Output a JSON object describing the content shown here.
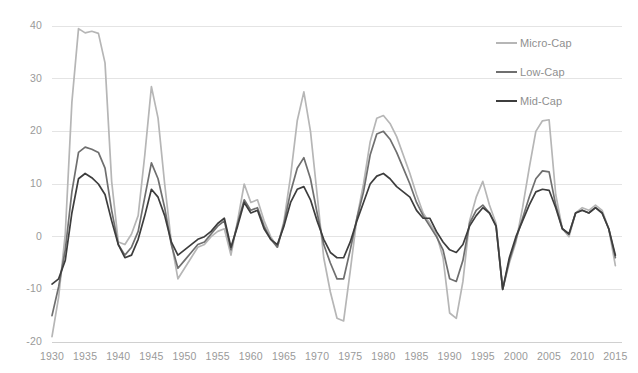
{
  "chart_data": {
    "type": "line",
    "title": "",
    "subtitle": "",
    "xlabel": "",
    "ylabel": "",
    "xlim": [
      1930,
      2016
    ],
    "ylim": [
      -20,
      40
    ],
    "ytick_values": [
      40,
      30,
      20,
      10,
      0,
      -10,
      -20
    ],
    "ytick_labels": [
      "40",
      "30",
      "20",
      "10",
      "0",
      "-10",
      "-20"
    ],
    "xtick_values": [
      1930,
      1935,
      1940,
      1945,
      1950,
      1955,
      1960,
      1965,
      1970,
      1975,
      1980,
      1985,
      1990,
      1995,
      2000,
      2005,
      2010,
      2015
    ],
    "xtick_labels": [
      "1930",
      "1935",
      "1940",
      "1945",
      "1950",
      "1955",
      "1960",
      "1965",
      "1970",
      "1975",
      "1980",
      "1985",
      "1990",
      "1995",
      "2000",
      "2005",
      "2010",
      "2015"
    ],
    "grid": "horizontal",
    "legend_position": "top-right",
    "x": [
      1930,
      1931,
      1932,
      1933,
      1934,
      1935,
      1936,
      1937,
      1938,
      1939,
      1940,
      1941,
      1942,
      1943,
      1944,
      1945,
      1946,
      1947,
      1948,
      1949,
      1950,
      1951,
      1952,
      1953,
      1954,
      1955,
      1956,
      1957,
      1958,
      1959,
      1960,
      1961,
      1962,
      1963,
      1964,
      1965,
      1966,
      1967,
      1968,
      1969,
      1970,
      1971,
      1972,
      1973,
      1974,
      1975,
      1976,
      1977,
      1978,
      1979,
      1980,
      1981,
      1982,
      1983,
      1984,
      1985,
      1986,
      1987,
      1988,
      1989,
      1990,
      1991,
      1992,
      1993,
      1994,
      1995,
      1996,
      1997,
      1998,
      1999,
      2000,
      2001,
      2002,
      2003,
      2004,
      2005,
      2006,
      2007,
      2008,
      2009,
      2010,
      2011,
      2012,
      2013,
      2014,
      2015
    ],
    "series": [
      {
        "name": "Micro-Cap",
        "color": "#b6b6b6",
        "values": [
          -19.0,
          -11.5,
          0.5,
          25.5,
          39.5,
          38.7,
          39.0,
          38.6,
          33.0,
          10.5,
          -1.0,
          -1.5,
          0.5,
          4.0,
          15.5,
          28.5,
          22.5,
          10.0,
          -1.0,
          -8.0,
          -6.0,
          -4.0,
          -2.0,
          -1.5,
          0.0,
          1.0,
          1.5,
          -3.5,
          3.0,
          10.0,
          6.5,
          7.0,
          3.0,
          0.0,
          -2.0,
          3.0,
          11.5,
          22.0,
          27.5,
          20.0,
          8.0,
          -4.0,
          -10.5,
          -15.5,
          -16.0,
          -6.5,
          3.5,
          10.0,
          18.0,
          22.5,
          23.0,
          21.5,
          19.0,
          15.5,
          12.0,
          8.0,
          4.5,
          2.5,
          0.5,
          -4.0,
          -14.5,
          -15.5,
          -8.5,
          3.0,
          7.5,
          10.5,
          6.0,
          2.5,
          -10.0,
          -5.0,
          -1.0,
          5.5,
          13.0,
          20.0,
          22.0,
          22.2,
          8.0,
          1.5,
          0.0,
          4.5,
          5.5,
          5.0,
          6.0,
          5.0,
          1.5,
          -5.5
        ]
      },
      {
        "name": "Low-Cap",
        "color": "#6f6f6f",
        "values": [
          -15.0,
          -9.5,
          -2.5,
          8.5,
          16.0,
          17.0,
          16.6,
          16.0,
          13.0,
          5.0,
          -1.5,
          -3.5,
          -2.0,
          1.0,
          7.5,
          14.0,
          11.0,
          5.5,
          -1.5,
          -6.0,
          -4.5,
          -3.0,
          -1.5,
          -1.0,
          0.5,
          2.0,
          3.0,
          -2.5,
          2.5,
          7.0,
          5.0,
          5.5,
          2.0,
          -0.5,
          -2.0,
          2.5,
          8.5,
          13.0,
          15.0,
          11.0,
          4.5,
          -1.5,
          -5.0,
          -8.0,
          -8.0,
          -2.5,
          3.5,
          8.5,
          15.5,
          19.5,
          20.0,
          18.5,
          16.0,
          13.0,
          10.0,
          6.5,
          4.0,
          2.0,
          0.0,
          -2.5,
          -8.0,
          -8.5,
          -4.5,
          2.5,
          5.0,
          6.0,
          4.5,
          2.0,
          -10.0,
          -4.5,
          -0.5,
          3.5,
          7.5,
          11.0,
          12.5,
          12.3,
          6.0,
          1.5,
          0.5,
          4.5,
          5.0,
          4.5,
          5.5,
          4.5,
          1.5,
          -4.0
        ]
      },
      {
        "name": "Mid-Cap",
        "color": "#3d3d3d",
        "values": [
          -9.0,
          -8.0,
          -4.5,
          4.5,
          11.0,
          12.0,
          11.2,
          10.0,
          8.0,
          3.0,
          -1.5,
          -4.0,
          -3.5,
          -0.5,
          4.0,
          9.0,
          7.5,
          4.0,
          -1.0,
          -3.5,
          -2.5,
          -1.5,
          -0.5,
          0.0,
          1.0,
          2.5,
          3.5,
          -2.0,
          2.0,
          6.5,
          4.5,
          5.0,
          1.5,
          -0.5,
          -1.5,
          2.0,
          6.5,
          9.0,
          9.5,
          7.0,
          3.0,
          -0.5,
          -3.0,
          -4.0,
          -4.0,
          -1.0,
          3.0,
          6.5,
          10.0,
          11.5,
          12.0,
          11.0,
          9.5,
          8.5,
          7.5,
          5.0,
          3.5,
          3.5,
          1.0,
          -1.0,
          -2.5,
          -3.0,
          -1.5,
          2.0,
          4.0,
          5.5,
          4.5,
          2.0,
          -10.0,
          -4.0,
          0.0,
          3.0,
          6.0,
          8.5,
          9.0,
          8.8,
          5.5,
          1.5,
          0.5,
          4.5,
          5.0,
          4.5,
          5.5,
          4.5,
          1.5,
          -3.5
        ]
      }
    ]
  },
  "legend": {
    "items": [
      {
        "label": "Micro-Cap",
        "color": "#b6b6b6"
      },
      {
        "label": "Low-Cap",
        "color": "#6f6f6f"
      },
      {
        "label": "Mid-Cap",
        "color": "#3d3d3d"
      }
    ]
  },
  "geometry": {
    "plot_left": 52,
    "plot_right": 622,
    "plot_top": 26,
    "plot_bottom": 342
  }
}
